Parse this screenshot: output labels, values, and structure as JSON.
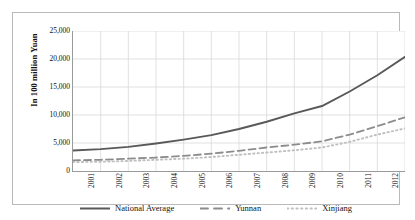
{
  "chart_data": {
    "type": "line",
    "title": "",
    "subtitle": "",
    "xlabel": "",
    "ylabel": "In 100 million Yuan",
    "grid": true,
    "legend_position": "bottom",
    "xlim": [
      2001,
      2013
    ],
    "ylim": [
      0,
      25000
    ],
    "categories": [
      "2001",
      "2002",
      "2003",
      "2004",
      "2005",
      "2006",
      "2007",
      "2008",
      "2009",
      "2010",
      "2011",
      "2012",
      "2013"
    ],
    "x": [
      2001,
      2002,
      2003,
      2004,
      2005,
      2006,
      2007,
      2008,
      2009,
      2010,
      2011,
      2012,
      2013
    ],
    "y_ticks": [
      0,
      5000,
      10000,
      15000,
      20000,
      25000
    ],
    "y_tick_labels": [
      "0",
      "5,000",
      "10,000",
      "15,000",
      "20,000",
      "25,000"
    ],
    "series": [
      {
        "name": "National Average",
        "style": "solid",
        "color": "#595959",
        "values": [
          3650,
          3900,
          4300,
          4900,
          5600,
          6400,
          7500,
          8800,
          10300,
          11600,
          14200,
          17100,
          20400
        ]
      },
      {
        "name": "Yunnan",
        "style": "dashed",
        "color": "#8c8c8c",
        "values": [
          1900,
          2000,
          2200,
          2400,
          2700,
          3100,
          3600,
          4200,
          4700,
          5300,
          6500,
          8000,
          9600
        ]
      },
      {
        "name": "Xinjiang",
        "style": "dotted",
        "color": "#bfbfbf",
        "values": [
          1600,
          1650,
          1800,
          2000,
          2200,
          2500,
          2900,
          3300,
          3700,
          4200,
          5200,
          6500,
          7600
        ]
      }
    ]
  },
  "axes": {
    "y_title": "In 100 million Yuan",
    "y_tick_labels": [
      "25,000",
      "20,000",
      "15,000",
      "10,000",
      "5,000",
      "0"
    ],
    "x_tick_labels": [
      "2001",
      "2002",
      "2003",
      "2004",
      "2005",
      "2006",
      "2007",
      "2008",
      "2009",
      "2010",
      "2011",
      "2012",
      "2013"
    ]
  },
  "legend": {
    "items": [
      {
        "label": "National Average",
        "style": "solid",
        "color": "#595959"
      },
      {
        "label": "Yunnan",
        "style": "dashed",
        "color": "#8c8c8c"
      },
      {
        "label": "Xinjiang",
        "style": "dotted",
        "color": "#bfbfbf"
      }
    ]
  },
  "colors": {
    "background": "#ffffff",
    "frame": "#b9b9b9",
    "axis": "#9a9a9a",
    "grid": "#d4d4d4",
    "text": "#111111"
  }
}
